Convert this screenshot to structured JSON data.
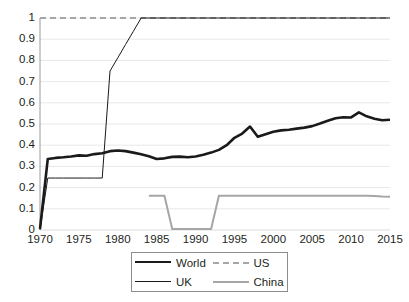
{
  "chart_data": {
    "type": "line",
    "title": "",
    "subtitle": "",
    "xlabel": "",
    "ylabel": "",
    "xlim": [
      1970,
      2015
    ],
    "ylim": [
      0,
      1
    ],
    "grid": true,
    "legend_position": "bottom",
    "y_ticks": [
      "0",
      "0.1",
      "0.2",
      "0.3",
      "0.4",
      "0.5",
      "0.6",
      "0.7",
      "0.8",
      "0.9",
      "1"
    ],
    "y_tick_values": [
      0,
      0.1,
      0.2,
      0.3,
      0.4,
      0.5,
      0.6,
      0.7,
      0.8,
      0.9,
      1
    ],
    "x_ticks": [
      "1970",
      "1975",
      "1980",
      "1985",
      "1990",
      "1995",
      "2000",
      "2005",
      "2010",
      "2015"
    ],
    "x_tick_values": [
      1970,
      1975,
      1980,
      1985,
      1990,
      1995,
      2000,
      2005,
      2010,
      2015
    ],
    "x": [
      1970,
      1971,
      1972,
      1973,
      1974,
      1975,
      1976,
      1977,
      1978,
      1979,
      1980,
      1981,
      1982,
      1983,
      1984,
      1985,
      1986,
      1987,
      1988,
      1989,
      1990,
      1991,
      1992,
      1993,
      1994,
      1995,
      1996,
      1997,
      1998,
      1999,
      2000,
      2001,
      2002,
      2003,
      2004,
      2005,
      2006,
      2007,
      2008,
      2009,
      2010,
      2011,
      2012,
      2013,
      2014,
      2015
    ],
    "series": [
      {
        "name": "World",
        "color": "#1a1a1a",
        "style": "solid",
        "width": 2.6,
        "values": [
          0.005,
          0.335,
          0.34,
          0.343,
          0.347,
          0.352,
          0.35,
          0.358,
          0.362,
          0.372,
          0.375,
          0.372,
          0.365,
          0.357,
          0.348,
          0.335,
          0.338,
          0.345,
          0.346,
          0.343,
          0.347,
          0.355,
          0.365,
          0.378,
          0.4,
          0.435,
          0.455,
          0.488,
          0.44,
          0.452,
          0.463,
          0.47,
          0.473,
          0.478,
          0.483,
          0.49,
          0.502,
          0.515,
          0.527,
          0.532,
          0.531,
          0.555,
          0.536,
          0.525,
          0.518,
          0.52
        ]
      },
      {
        "name": "US",
        "color": "#a6a6a6",
        "style": "dashed",
        "width": 2,
        "values": [
          1,
          1,
          1,
          1,
          1,
          1,
          1,
          1,
          1,
          1,
          1,
          1,
          1,
          1,
          1,
          1,
          1,
          1,
          1,
          1,
          1,
          1,
          1,
          1,
          1,
          1,
          1,
          1,
          1,
          1,
          1,
          1,
          1,
          1,
          1,
          1,
          1,
          1,
          1,
          1,
          1,
          1,
          1,
          1,
          1,
          1
        ]
      },
      {
        "name": "UK",
        "color": "#1a1a1a",
        "style": "solid",
        "width": 1,
        "values": [
          0,
          0.245,
          0.245,
          0.245,
          0.245,
          0.245,
          0.245,
          0.245,
          0.245,
          0.75,
          0.812,
          0.875,
          0.937,
          1,
          1,
          1,
          1,
          1,
          1,
          1,
          1,
          1,
          1,
          1,
          1,
          1,
          1,
          1,
          1,
          1,
          1,
          1,
          1,
          1,
          1,
          1,
          1,
          1,
          1,
          1,
          1,
          1,
          1,
          1,
          1,
          1
        ]
      },
      {
        "name": "China",
        "color": "#a6a6a6",
        "style": "solid",
        "width": 2,
        "values": [
          null,
          null,
          null,
          null,
          null,
          null,
          null,
          null,
          null,
          null,
          null,
          null,
          null,
          null,
          0.162,
          0.162,
          0.162,
          0.005,
          0.005,
          0.005,
          0.005,
          0.005,
          0.005,
          0.162,
          0.162,
          0.162,
          0.162,
          0.162,
          0.162,
          0.162,
          0.162,
          0.162,
          0.162,
          0.162,
          0.162,
          0.162,
          0.162,
          0.162,
          0.162,
          0.162,
          0.162,
          0.162,
          0.162,
          0.16,
          0.158,
          0.157
        ]
      }
    ],
    "legend": [
      {
        "label": "World",
        "color": "#1a1a1a",
        "style": "solid"
      },
      {
        "label": "US",
        "color": "#a6a6a6",
        "style": "dashed"
      },
      {
        "label": "UK",
        "color": "#1a1a1a",
        "style": "solid"
      },
      {
        "label": "China",
        "color": "#a6a6a6",
        "style": "solid"
      }
    ],
    "colors": {
      "grid": "#e8e8e8",
      "axis": "#9a9a9a",
      "text": "#231f20",
      "background": "#ffffff"
    }
  }
}
